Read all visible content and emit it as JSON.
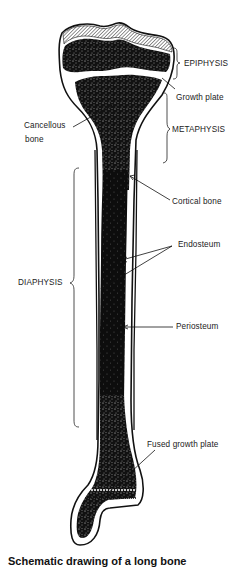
{
  "figure": {
    "type": "labeled anatomical diagram",
    "labels": {
      "epiphysis": "EPIPHYSIS",
      "growth_plate": "Growth plate",
      "metaphysis": "METAPHYSIS",
      "cancellous_bone_line1": "Cancellous",
      "cancellous_bone_line2": "bone",
      "cortical_bone": "Cortical bone",
      "endosteum": "Endosteum",
      "diaphysis": "DIAPHYSIS",
      "periosteum": "Periosteum",
      "fused_growth_plate": "Fused growth plate"
    },
    "caption_partial": "Schematic drawing of a long bone"
  },
  "colors": {
    "ink": "#111111",
    "paper": "#ffffff",
    "text": "#222222"
  }
}
